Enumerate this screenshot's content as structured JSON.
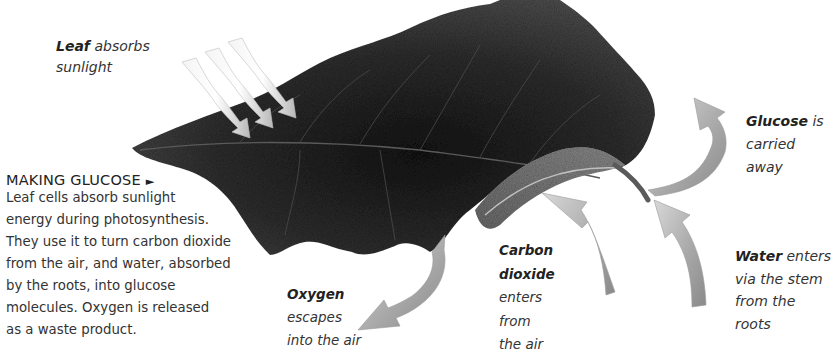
{
  "diagram": {
    "colors": {
      "background": "#ffffff",
      "leaf_dark": "#1f1f1f",
      "leaf_mid": "#4a4a4a",
      "leaf_light": "#7a7a7a",
      "arrow_light": "#e6e6e6",
      "arrow_mid": "#a9a9a9",
      "arrow_dark": "#8c8c8c",
      "text": "#333333"
    },
    "labels": {
      "sunlight": {
        "bold": "Leaf",
        "lines": [
          "absorbs",
          "sunlight"
        ]
      },
      "glucose": {
        "bold": "Glucose",
        "lines": [
          "is",
          "carried",
          "away"
        ]
      },
      "oxygen": {
        "bold": "Oxygen",
        "lines": [
          "escapes",
          "into the air"
        ]
      },
      "carbon_dioxide": {
        "bold_lines": [
          "Carbon",
          "dioxide"
        ],
        "lines": [
          "enters",
          "from",
          "the air"
        ]
      },
      "water": {
        "bold": "Water",
        "lines": [
          "enters",
          "via the stem",
          "from the",
          "roots"
        ]
      }
    },
    "caption": {
      "heading": "MAKING GLUCOSE",
      "heading_icon": "►",
      "lines": [
        "Leaf cells absorb sunlight",
        "energy during photosynthesis.",
        "They use it to turn carbon dioxide",
        "from the air, and water, absorbed",
        "by the roots, into glucose",
        "molecules. Oxygen is released",
        "as a waste product."
      ]
    },
    "arrows": [
      {
        "name": "sunlight-arrow",
        "count": 3,
        "direction": "down-right"
      },
      {
        "name": "glucose-arrow",
        "direction": "up, curving away from stem"
      },
      {
        "name": "oxygen-arrow",
        "direction": "down-left out of leaf"
      },
      {
        "name": "carbon-dioxide-arrow",
        "direction": "up into leaf"
      },
      {
        "name": "water-arrow",
        "direction": "up into stem"
      }
    ]
  }
}
